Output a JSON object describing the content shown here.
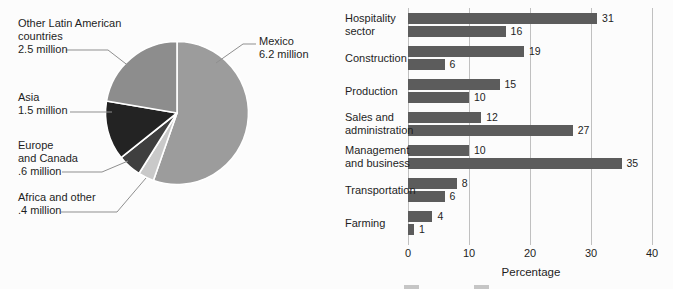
{
  "figure": {
    "background": "#fcfcfc",
    "text_color": "#1e1e1e"
  },
  "chart_data": [
    {
      "type": "pie",
      "title": "",
      "unit": "million",
      "total": 11.2,
      "direction": "clockwise",
      "start_angle_deg": 0,
      "divider_color": "#ffffff",
      "leader_line_color": "#8f8f8f",
      "slices": [
        {
          "name": "Mexico",
          "value": 6.2,
          "label": "Mexico\n6.2 million",
          "color": "#9c9c9c"
        },
        {
          "name": "Africa and other",
          "value": 0.4,
          "label": "Africa and other\n.4 million",
          "color": "#c9c9c9"
        },
        {
          "name": "Europe and Canada",
          "value": 0.6,
          "label": "Europe\nand Canada\n.6 million",
          "color": "#3f3f3f"
        },
        {
          "name": "Asia",
          "value": 1.5,
          "label": "Asia\n1.5 million",
          "color": "#232323"
        },
        {
          "name": "Other Latin American countries",
          "value": 2.5,
          "label": "Other Latin American\ncountries\n2.5 million",
          "color": "#8d8d8d"
        }
      ]
    },
    {
      "type": "bar",
      "orientation": "horizontal",
      "categories": [
        "Hospitality\nsector",
        "Construction",
        "Production",
        "Sales and\nadministration",
        "Management\nand business",
        "Transportation",
        "Farming"
      ],
      "series": [
        {
          "name": "series-1",
          "values": [
            31,
            19,
            15,
            12,
            10,
            8,
            4
          ]
        },
        {
          "name": "series-2",
          "values": [
            16,
            6,
            10,
            27,
            35,
            6,
            1
          ]
        }
      ],
      "bar_color": "#5c5c5c",
      "grid_color": "#c0c0c0",
      "grid": true,
      "xlabel": "Percentage",
      "xlim": [
        0,
        40
      ],
      "xticks": [
        0,
        10,
        20,
        30,
        40
      ]
    }
  ]
}
